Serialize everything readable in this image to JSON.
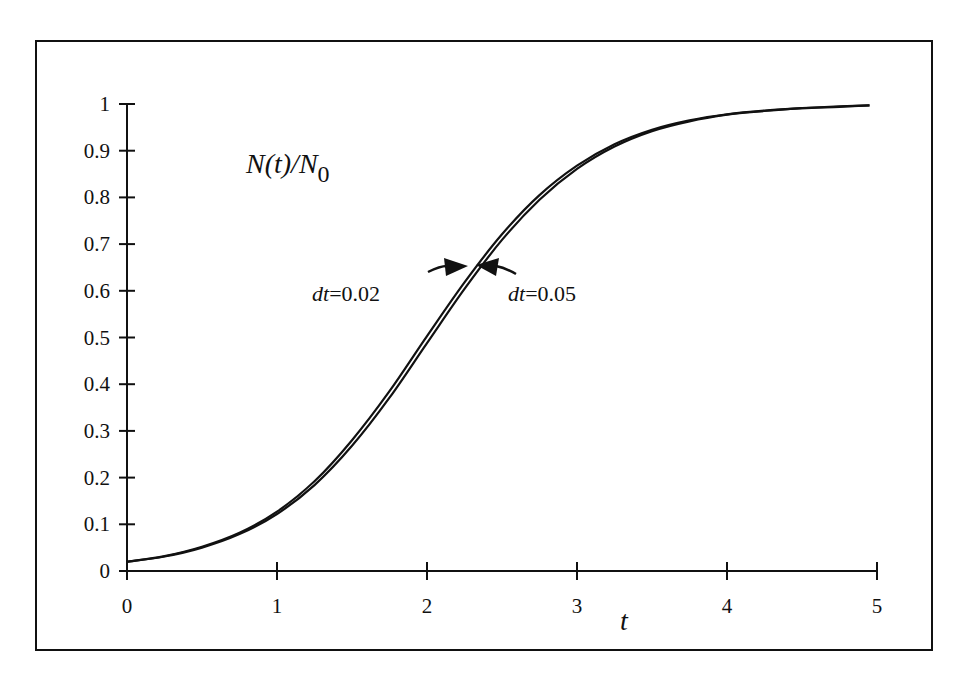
{
  "chart_data": {
    "type": "line",
    "title": "N(t)/N0",
    "title_main": "N(t)/N",
    "title_sub": "0",
    "xlabel": "t",
    "ylabel": "",
    "xlim": [
      0,
      5
    ],
    "ylim": [
      0,
      1
    ],
    "grid": false,
    "legend": "none (inline arrow annotations)",
    "x_ticks": [
      "0",
      "1",
      "2",
      "3",
      "4",
      "5"
    ],
    "y_ticks": [
      "0",
      "0.1",
      "0.2",
      "0.3",
      "0.4",
      "0.5",
      "0.6",
      "0.7",
      "0.8",
      "0.9",
      "1"
    ],
    "annotations": [
      {
        "prefix": "dt",
        "text": "=0.02",
        "points_to": "dt=0.02 curve",
        "x": 2.27,
        "y": 0.65
      },
      {
        "prefix": "dt",
        "text": "=0.05",
        "points_to": "dt=0.05 curve",
        "x": 2.33,
        "y": 0.65
      }
    ],
    "x": [
      0,
      0.25,
      0.5,
      0.75,
      1.0,
      1.25,
      1.5,
      1.75,
      2.0,
      2.25,
      2.5,
      2.75,
      3.0,
      3.25,
      3.5,
      3.75,
      4.0,
      4.25,
      4.5,
      4.75,
      4.95
    ],
    "series": [
      {
        "name": "dt=0.02",
        "values": [
          0.02,
          0.032,
          0.052,
          0.082,
          0.127,
          0.192,
          0.28,
          0.385,
          0.503,
          0.618,
          0.721,
          0.805,
          0.868,
          0.914,
          0.945,
          0.965,
          0.978,
          0.986,
          0.991,
          0.995,
          0.997
        ]
      },
      {
        "name": "dt=0.05",
        "values": [
          0.02,
          0.031,
          0.05,
          0.079,
          0.122,
          0.184,
          0.268,
          0.371,
          0.488,
          0.604,
          0.709,
          0.795,
          0.861,
          0.909,
          0.942,
          0.963,
          0.977,
          0.985,
          0.991,
          0.994,
          0.997
        ]
      }
    ]
  },
  "labels": {
    "ann_left_prefix": "dt",
    "ann_left_value": "=0.02",
    "ann_right_prefix": "dt",
    "ann_right_value": "=0.05"
  }
}
